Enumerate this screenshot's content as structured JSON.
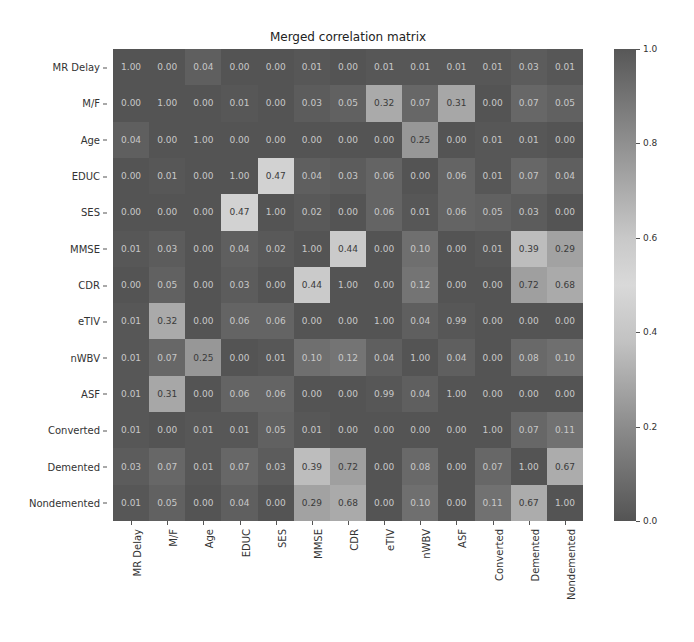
{
  "chart_data": {
    "type": "heatmap",
    "title": "Merged correlation matrix",
    "xlabel": "",
    "ylabel": "",
    "labels": [
      "MR Delay",
      "M/F",
      "Age",
      "EDUC",
      "SES",
      "MMSE",
      "CDR",
      "eTIV",
      "nWBV",
      "ASF",
      "Converted",
      "Demented",
      "Nondemented"
    ],
    "matrix": [
      [
        1.0,
        0.0,
        0.04,
        0.0,
        0.0,
        0.01,
        0.0,
        0.01,
        0.01,
        0.01,
        0.01,
        0.03,
        0.01
      ],
      [
        0.0,
        1.0,
        0.0,
        0.01,
        0.0,
        0.03,
        0.05,
        0.32,
        0.07,
        0.31,
        0.0,
        0.07,
        0.05
      ],
      [
        0.04,
        0.0,
        1.0,
        0.0,
        0.0,
        0.0,
        0.0,
        0.0,
        0.25,
        0.0,
        0.01,
        0.01,
        0.0
      ],
      [
        0.0,
        0.01,
        0.0,
        1.0,
        0.47,
        0.04,
        0.03,
        0.06,
        0.0,
        0.06,
        0.01,
        0.07,
        0.04
      ],
      [
        0.0,
        0.0,
        0.0,
        0.47,
        1.0,
        0.02,
        0.0,
        0.06,
        0.01,
        0.06,
        0.05,
        0.03,
        0.0
      ],
      [
        0.01,
        0.03,
        0.0,
        0.04,
        0.02,
        1.0,
        0.44,
        0.0,
        0.1,
        0.0,
        0.01,
        0.39,
        0.29
      ],
      [
        0.0,
        0.05,
        0.0,
        0.03,
        0.0,
        0.44,
        1.0,
        0.0,
        0.12,
        0.0,
        0.0,
        0.72,
        0.68
      ],
      [
        0.01,
        0.32,
        0.0,
        0.06,
        0.06,
        0.0,
        0.0,
        1.0,
        0.04,
        0.99,
        0.0,
        0.0,
        0.0
      ],
      [
        0.01,
        0.07,
        0.25,
        0.0,
        0.01,
        0.1,
        0.12,
        0.04,
        1.0,
        0.04,
        0.0,
        0.08,
        0.1
      ],
      [
        0.01,
        0.31,
        0.0,
        0.06,
        0.06,
        0.0,
        0.0,
        0.99,
        0.04,
        1.0,
        0.0,
        0.0,
        0.0
      ],
      [
        0.01,
        0.0,
        0.01,
        0.01,
        0.05,
        0.01,
        0.0,
        0.0,
        0.0,
        0.0,
        1.0,
        0.07,
        0.11
      ],
      [
        0.03,
        0.07,
        0.01,
        0.07,
        0.03,
        0.39,
        0.72,
        0.0,
        0.08,
        0.0,
        0.07,
        1.0,
        0.67
      ],
      [
        0.01,
        0.05,
        0.0,
        0.04,
        0.0,
        0.29,
        0.68,
        0.0,
        0.1,
        0.0,
        0.11,
        0.67,
        1.0
      ]
    ],
    "value_format": "0.00",
    "colorbar": {
      "range": [
        0.0,
        1.0
      ],
      "ticks": [
        "0.0",
        "0.2",
        "0.4",
        "0.6",
        "0.8",
        "1.0"
      ],
      "colormap": "greyscale diverging (dark at 0 and 1, light at 0.5)"
    },
    "grid": false,
    "legend_position": "right (colorbar)"
  }
}
